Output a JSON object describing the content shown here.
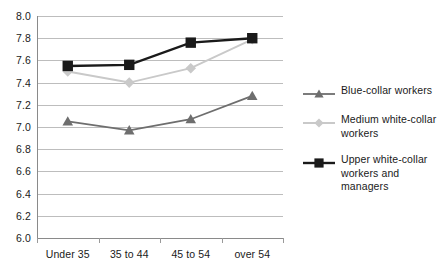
{
  "chart_data": {
    "type": "line",
    "title": "",
    "subtitle": "",
    "xlabel": "",
    "ylabel": "",
    "categories": [
      "Under 35",
      "35 to 44",
      "45 to 54",
      "over 54"
    ],
    "ylim": [
      6.0,
      8.0
    ],
    "y_ticks": [
      "6.0",
      "6.2",
      "6.4",
      "6.6",
      "6.8",
      "7.0",
      "7.2",
      "7.4",
      "7.6",
      "7.8",
      "8.0"
    ],
    "grid": true,
    "legend_position": "right",
    "series": [
      {
        "name": "Blue-collar workers",
        "values": [
          7.05,
          6.97,
          7.07,
          7.28
        ],
        "color": "#6e6e6e",
        "marker": "triangle"
      },
      {
        "name": "Medium white-collar workers",
        "values": [
          7.5,
          7.4,
          7.53,
          7.79
        ],
        "color": "#c9c9c9",
        "marker": "diamond"
      },
      {
        "name": "Upper white-collar workers and managers",
        "values": [
          7.55,
          7.56,
          7.76,
          7.8
        ],
        "color": "#1a1a1a",
        "marker": "square"
      }
    ]
  },
  "legend": {
    "items": [
      {
        "label": "Blue-collar workers"
      },
      {
        "label": "Medium white-collar workers"
      },
      {
        "label": "Upper white-collar workers and managers"
      }
    ]
  }
}
